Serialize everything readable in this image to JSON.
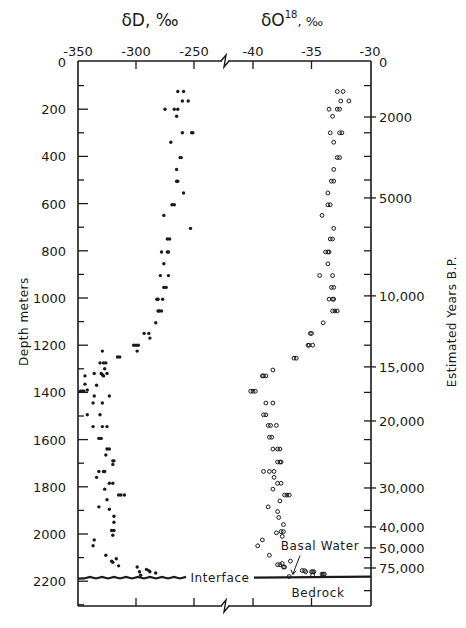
{
  "chart_data": [
    {
      "type": "scatter",
      "title": "",
      "panel": "deuterium",
      "xlabel": "δD, ‰",
      "ylabel": "Depth meters",
      "xlim": [
        -350,
        -240
      ],
      "ylim": [
        2300,
        0
      ],
      "x_ticks": [
        -350,
        -300,
        -250
      ],
      "x_tick_labels": [
        "-350",
        "-300",
        "-250"
      ],
      "marker": "filled-dot",
      "series": [
        {
          "name": "δD",
          "points": [
            [
              -264,
              125
            ],
            [
              -259,
              125
            ],
            [
              -260,
              165
            ],
            [
              -255,
              165
            ],
            [
              -275,
              200
            ],
            [
              -267,
              200
            ],
            [
              -264,
              200
            ],
            [
              -265,
              230
            ],
            [
              -260,
              300
            ],
            [
              -252,
              300
            ],
            [
              -251,
              300
            ],
            [
              -270,
              340
            ],
            [
              -262,
              405
            ],
            [
              -261,
              405
            ],
            [
              -265,
              455
            ],
            [
              -265,
              505
            ],
            [
              -264,
              505
            ],
            [
              -259,
              555
            ],
            [
              -269,
              605
            ],
            [
              -267,
              605
            ],
            [
              -276,
              650
            ],
            [
              -253,
              705
            ],
            [
              -273,
              750
            ],
            [
              -271,
              750
            ],
            [
              -278,
              805
            ],
            [
              -273,
              805
            ],
            [
              -272,
              805
            ],
            [
              -276,
              855
            ],
            [
              -279,
              905
            ],
            [
              -272,
              905
            ],
            [
              -276,
              955
            ],
            [
              -274,
              955
            ],
            [
              -282,
              1005
            ],
            [
              -281,
              1005
            ],
            [
              -277,
              1005
            ],
            [
              -281,
              1055
            ],
            [
              -280,
              1055
            ],
            [
              -278,
              1055
            ],
            [
              -283,
              1105
            ],
            [
              -293,
              1150
            ],
            [
              -289,
              1150
            ],
            [
              -288,
              1170
            ],
            [
              -302,
              1200
            ],
            [
              -300,
              1200
            ],
            [
              -298,
              1200
            ],
            [
              -299,
              1225
            ],
            [
              -329,
              1225
            ],
            [
              -316,
              1250
            ],
            [
              -314,
              1250
            ],
            [
              -331,
              1275
            ],
            [
              -328,
              1275
            ],
            [
              -326,
              1275
            ],
            [
              -327,
              1300
            ],
            [
              -336,
              1320
            ],
            [
              -330,
              1320
            ],
            [
              -344,
              1330
            ],
            [
              -329,
              1325
            ],
            [
              -325,
              1320
            ],
            [
              -328,
              1330
            ],
            [
              -334,
              1370
            ],
            [
              -344,
              1365
            ],
            [
              -348,
              1395
            ],
            [
              -347,
              1395
            ],
            [
              -346,
              1395
            ],
            [
              -345,
              1395
            ],
            [
              -342,
              1390
            ],
            [
              -336,
              1415
            ],
            [
              -323,
              1415
            ],
            [
              -337,
              1445
            ],
            [
              -329,
              1445
            ],
            [
              -342,
              1495
            ],
            [
              -331,
              1495
            ],
            [
              -329,
              1545
            ],
            [
              -325,
              1545
            ],
            [
              -337,
              1545
            ],
            [
              -332,
              1595
            ],
            [
              -330,
              1595
            ],
            [
              -325,
              1640
            ],
            [
              -323,
              1640
            ],
            [
              -326,
              1665
            ],
            [
              -320,
              1690
            ],
            [
              -319,
              1690
            ],
            [
              -320,
              1705
            ],
            [
              -332,
              1735
            ],
            [
              -328,
              1735
            ],
            [
              -327,
              1735
            ],
            [
              -334,
              1760
            ],
            [
              -323,
              1785
            ],
            [
              -320,
              1785
            ],
            [
              -327,
              1810
            ],
            [
              -315,
              1835
            ],
            [
              -313,
              1835
            ],
            [
              -310,
              1835
            ],
            [
              -325,
              1855
            ],
            [
              -332,
              1885
            ],
            [
              -323,
              1895
            ],
            [
              -319,
              1925
            ],
            [
              -319,
              1950
            ],
            [
              -321,
              1985
            ],
            [
              -319,
              1985
            ],
            [
              -320,
              2005
            ],
            [
              -336,
              2025
            ],
            [
              -337,
              2050
            ],
            [
              -326,
              2090
            ],
            [
              -317,
              2105
            ],
            [
              -321,
              2115
            ],
            [
              -320,
              2120
            ],
            [
              -315,
              2135
            ],
            [
              -299,
              2140
            ],
            [
              -297,
              2160
            ],
            [
              -296,
              2175
            ],
            [
              -291,
              2150
            ],
            [
              -289,
              2155
            ],
            [
              -288,
              2160
            ],
            [
              -283,
              2165
            ]
          ]
        }
      ]
    },
    {
      "type": "scatter",
      "title": "",
      "panel": "oxygen-18",
      "xlabel": "δO18, ‰",
      "ylabel": "Estimated Years B.P.",
      "xlim": [
        -42.5,
        -30
      ],
      "ylim": [
        2300,
        0
      ],
      "x_ticks": [
        -40,
        -35,
        -30
      ],
      "x_tick_labels": [
        "-40",
        "-35",
        "-30"
      ],
      "marker": "open-circle",
      "series": [
        {
          "name": "δO18",
          "points": [
            [
              -32.8,
              125
            ],
            [
              -32.3,
              125
            ],
            [
              -32.5,
              165
            ],
            [
              -31.8,
              165
            ],
            [
              -33.5,
              200
            ],
            [
              -32.8,
              200
            ],
            [
              -32.6,
              200
            ],
            [
              -33.2,
              230
            ],
            [
              -33.4,
              300
            ],
            [
              -32.6,
              300
            ],
            [
              -32.4,
              300
            ],
            [
              -33.1,
              340
            ],
            [
              -32.8,
              405
            ],
            [
              -32.6,
              405
            ],
            [
              -33.1,
              455
            ],
            [
              -33.3,
              505
            ],
            [
              -33.1,
              505
            ],
            [
              -33.6,
              555
            ],
            [
              -33.6,
              605
            ],
            [
              -33.4,
              605
            ],
            [
              -34.1,
              650
            ],
            [
              -33.1,
              705
            ],
            [
              -33.4,
              750
            ],
            [
              -33.2,
              750
            ],
            [
              -33.8,
              805
            ],
            [
              -33.6,
              805
            ],
            [
              -33.5,
              805
            ],
            [
              -33.6,
              855
            ],
            [
              -34.3,
              905
            ],
            [
              -33.2,
              905
            ],
            [
              -33.3,
              955
            ],
            [
              -33.1,
              955
            ],
            [
              -33.5,
              1005
            ],
            [
              -33.2,
              1005
            ],
            [
              -33.1,
              1005
            ],
            [
              -33.2,
              1055
            ],
            [
              -33.0,
              1055
            ],
            [
              -32.8,
              1055
            ],
            [
              -34.0,
              1105
            ],
            [
              -35.1,
              1150
            ],
            [
              -35.0,
              1150
            ],
            [
              -35.3,
              1200
            ],
            [
              -35.2,
              1200
            ],
            [
              -34.9,
              1200
            ],
            [
              -36.5,
              1255
            ],
            [
              -36.3,
              1255
            ],
            [
              -38.3,
              1305
            ],
            [
              -39.2,
              1330
            ],
            [
              -39.1,
              1330
            ],
            [
              -38.9,
              1330
            ],
            [
              -40.2,
              1395
            ],
            [
              -40.0,
              1395
            ],
            [
              -39.8,
              1395
            ],
            [
              -38.9,
              1445
            ],
            [
              -38.3,
              1445
            ],
            [
              -39.1,
              1495
            ],
            [
              -38.9,
              1495
            ],
            [
              -38.7,
              1540
            ],
            [
              -38.5,
              1540
            ],
            [
              -38.0,
              1540
            ],
            [
              -38.6,
              1590
            ],
            [
              -38.4,
              1590
            ],
            [
              -38.3,
              1640
            ],
            [
              -37.9,
              1640
            ],
            [
              -37.7,
              1640
            ],
            [
              -37.9,
              1695
            ],
            [
              -37.7,
              1695
            ],
            [
              -37.6,
              1695
            ],
            [
              -39.1,
              1735
            ],
            [
              -38.6,
              1735
            ],
            [
              -38.2,
              1735
            ],
            [
              -38.2,
              1760
            ],
            [
              -37.9,
              1785
            ],
            [
              -37.6,
              1785
            ],
            [
              -38.3,
              1810
            ],
            [
              -37.3,
              1835
            ],
            [
              -37.1,
              1835
            ],
            [
              -36.9,
              1835
            ],
            [
              -37.7,
              1860
            ],
            [
              -38.7,
              1885
            ],
            [
              -37.9,
              1905
            ],
            [
              -37.8,
              1930
            ],
            [
              -37.4,
              1960
            ],
            [
              -37.6,
              1990
            ],
            [
              -37.4,
              1990
            ],
            [
              -38.0,
              1995
            ],
            [
              -37.5,
              2010
            ],
            [
              -39.2,
              2025
            ],
            [
              -39.6,
              2050
            ],
            [
              -38.6,
              2090
            ],
            [
              -37.9,
              2130
            ],
            [
              -37.7,
              2130
            ],
            [
              -37.5,
              2125
            ],
            [
              -37.4,
              2140
            ],
            [
              -37.3,
              2140
            ],
            [
              -36.8,
              2115
            ],
            [
              -35.8,
              2155
            ],
            [
              -35.6,
              2155
            ],
            [
              -35.5,
              2160
            ],
            [
              -35.0,
              2160
            ],
            [
              -34.9,
              2160
            ],
            [
              -34.8,
              2160
            ],
            [
              -34.9,
              2175
            ],
            [
              -34.1,
              2170
            ],
            [
              -34.0,
              2170
            ],
            [
              -33.9,
              2170
            ],
            [
              -36.9,
              2180
            ]
          ]
        }
      ]
    }
  ],
  "axes": {
    "top_left_title": "δD, ‰",
    "top_right_title_main": "δO",
    "top_right_title_sup": "18",
    "top_right_title_suffix": ", ‰",
    "left_ylabel": "Depth meters",
    "right_ylabel": "Estimated Years B.P.",
    "depth_ticks": [
      0,
      100,
      200,
      300,
      400,
      500,
      600,
      700,
      800,
      900,
      1000,
      1100,
      1200,
      1300,
      1400,
      1500,
      1600,
      1700,
      1800,
      1900,
      2000,
      2100,
      2200,
      2300
    ],
    "depth_labels": [
      {
        "depth": 0,
        "label": "0"
      },
      {
        "depth": 200,
        "label": "200"
      },
      {
        "depth": 400,
        "label": "400"
      },
      {
        "depth": 600,
        "label": "600"
      },
      {
        "depth": 800,
        "label": "800"
      },
      {
        "depth": 1000,
        "label": "1000"
      },
      {
        "depth": 1200,
        "label": "1200"
      },
      {
        "depth": 1400,
        "label": "1400"
      },
      {
        "depth": 1600,
        "label": "1600"
      },
      {
        "depth": 1800,
        "label": "1800"
      },
      {
        "depth": 2000,
        "label": "2000"
      },
      {
        "depth": 2200,
        "label": "2200"
      }
    ],
    "age_labels": [
      {
        "depth": 0,
        "label": "0"
      },
      {
        "depth": 233,
        "label": "2000"
      },
      {
        "depth": 576,
        "label": "5000"
      },
      {
        "depth": 991,
        "label": "10,000"
      },
      {
        "depth": 1292,
        "label": "15,000"
      },
      {
        "depth": 1521,
        "label": "20,000"
      },
      {
        "depth": 1805,
        "label": "30,000"
      },
      {
        "depth": 1970,
        "label": "40,000"
      },
      {
        "depth": 2059,
        "label": "50,000"
      },
      {
        "depth": 2144,
        "label": "75,000"
      }
    ],
    "age_minor_tick_depths": [
      100,
      300,
      400,
      500,
      700,
      800,
      900,
      1100,
      1200,
      1400,
      1600,
      1700,
      1900,
      2100,
      2240
    ]
  },
  "annotations": {
    "interface_label": "Interface",
    "interface_depth": 2185,
    "basal_water_label": "Basal Water",
    "bedrock_label": "Bedrock"
  }
}
